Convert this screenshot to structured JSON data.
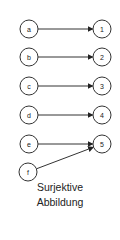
{
  "diagram": {
    "domain_nodes": [
      {
        "id": "a",
        "label": "a",
        "cx": 29,
        "cy": 29
      },
      {
        "id": "b",
        "label": "b",
        "cx": 29,
        "cy": 57
      },
      {
        "id": "c",
        "label": "c",
        "cx": 29,
        "cy": 86
      },
      {
        "id": "d",
        "label": "d",
        "cx": 29,
        "cy": 115
      },
      {
        "id": "e",
        "label": "e",
        "cx": 29,
        "cy": 144
      },
      {
        "id": "f",
        "label": "f",
        "cx": 28,
        "cy": 172
      }
    ],
    "codomain_nodes": [
      {
        "id": "1",
        "label": "1",
        "cx": 102,
        "cy": 29
      },
      {
        "id": "2",
        "label": "2",
        "cx": 102,
        "cy": 57
      },
      {
        "id": "3",
        "label": "3",
        "cx": 102,
        "cy": 86
      },
      {
        "id": "4",
        "label": "4",
        "cx": 102,
        "cy": 115
      },
      {
        "id": "5",
        "label": "5",
        "cx": 102,
        "cy": 144
      }
    ],
    "edges": [
      {
        "from": "a",
        "to": "1"
      },
      {
        "from": "b",
        "to": "2"
      },
      {
        "from": "c",
        "to": "3"
      },
      {
        "from": "d",
        "to": "4"
      },
      {
        "from": "e",
        "to": "5"
      },
      {
        "from": "f",
        "to": "5"
      }
    ],
    "caption_line1": "Surjektive",
    "caption_line2": "Abbildung",
    "colors": {
      "stroke": "#333333",
      "text": "#222222",
      "background": "#ffffff"
    }
  }
}
